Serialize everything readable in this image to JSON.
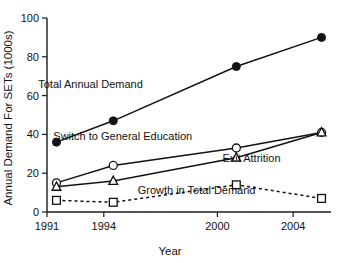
{
  "chart_data": {
    "type": "line",
    "title": "",
    "subtitle": "",
    "xlabel": "Year",
    "ylabel": "Annual Demand For SETs (1000s)",
    "xlim": [
      1991,
      2006
    ],
    "ylim": [
      0,
      100
    ],
    "x_ticks": [
      1991,
      1994,
      2000,
      2004
    ],
    "x_tick_labels": [
      "1991",
      "1994",
      "2000",
      "2004"
    ],
    "y_ticks": [
      0,
      20,
      40,
      60,
      80,
      100
    ],
    "y_tick_labels": [
      "0",
      "20",
      "40",
      "60",
      "80",
      "100"
    ],
    "grid": false,
    "legend": "inline-annotations",
    "x": [
      1991.5,
      1994.5,
      2001,
      2005.5
    ],
    "series": [
      {
        "name": "Total Annual Demand",
        "marker": "filled-circle",
        "line_style": "solid",
        "values": [
          36,
          47,
          75,
          90
        ],
        "label_x": 1993.3,
        "label_y": 64
      },
      {
        "name": "Switch to General Education",
        "marker": "open-circle",
        "line_style": "solid",
        "values": [
          15,
          24,
          33,
          41
        ],
        "label_x": 1995.0,
        "label_y": 37
      },
      {
        "name": "Exit Attrition",
        "marker": "open-triangle",
        "line_style": "solid",
        "values": [
          13,
          16,
          28,
          41
        ],
        "label_x": 2001.8,
        "label_y": 26
      },
      {
        "name": "Growth in Total Demand",
        "marker": "open-square",
        "line_style": "dashed",
        "values": [
          6,
          5,
          14,
          7
        ],
        "label_x": 1998.9,
        "label_y": 9.5
      }
    ]
  }
}
